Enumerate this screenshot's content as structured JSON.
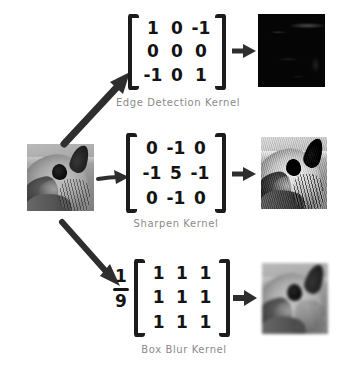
{
  "diagram": {
    "source_image": {
      "name": "source-image",
      "alt": "grayscale photo of an animal head in profile"
    },
    "accent_colors": {
      "ink": "#141414",
      "caption": "#8a8a8a",
      "arrow": "#2e2e2e",
      "background": "#ffffff"
    },
    "rows": [
      {
        "id": "edge-detection",
        "caption": "Edge Detection Kernel",
        "scalar": "",
        "kernel": [
          [
            "1",
            "0",
            "-1"
          ],
          [
            "0",
            "0",
            "0"
          ],
          [
            "-1",
            "0",
            "1"
          ]
        ],
        "output_alt": "near-black edge detection result"
      },
      {
        "id": "sharpen",
        "caption": "Sharpen Kernel",
        "scalar": "",
        "kernel": [
          [
            "0",
            "-1",
            "0"
          ],
          [
            "-1",
            "5",
            "-1"
          ],
          [
            "0",
            "-1",
            "0"
          ]
        ],
        "output_alt": "sharpened high contrast animal head"
      },
      {
        "id": "box-blur",
        "caption": "Box Blur Kernel",
        "scalar": {
          "numerator": "1",
          "denominator": "9"
        },
        "kernel": [
          [
            "1",
            "1",
            "1"
          ],
          [
            "1",
            "1",
            "1"
          ],
          [
            "1",
            "1",
            "1"
          ]
        ],
        "output_alt": "blurred animal head"
      }
    ],
    "arrows": [
      {
        "name": "arrow-source-to-edge",
        "direction": "up-right"
      },
      {
        "name": "arrow-source-to-sharpen",
        "direction": "right"
      },
      {
        "name": "arrow-source-to-blur",
        "direction": "down-right"
      },
      {
        "name": "arrow-edge-kernel-to-output",
        "direction": "right"
      },
      {
        "name": "arrow-sharpen-kernel-to-output",
        "direction": "right"
      },
      {
        "name": "arrow-blur-kernel-to-output",
        "direction": "right"
      }
    ]
  }
}
